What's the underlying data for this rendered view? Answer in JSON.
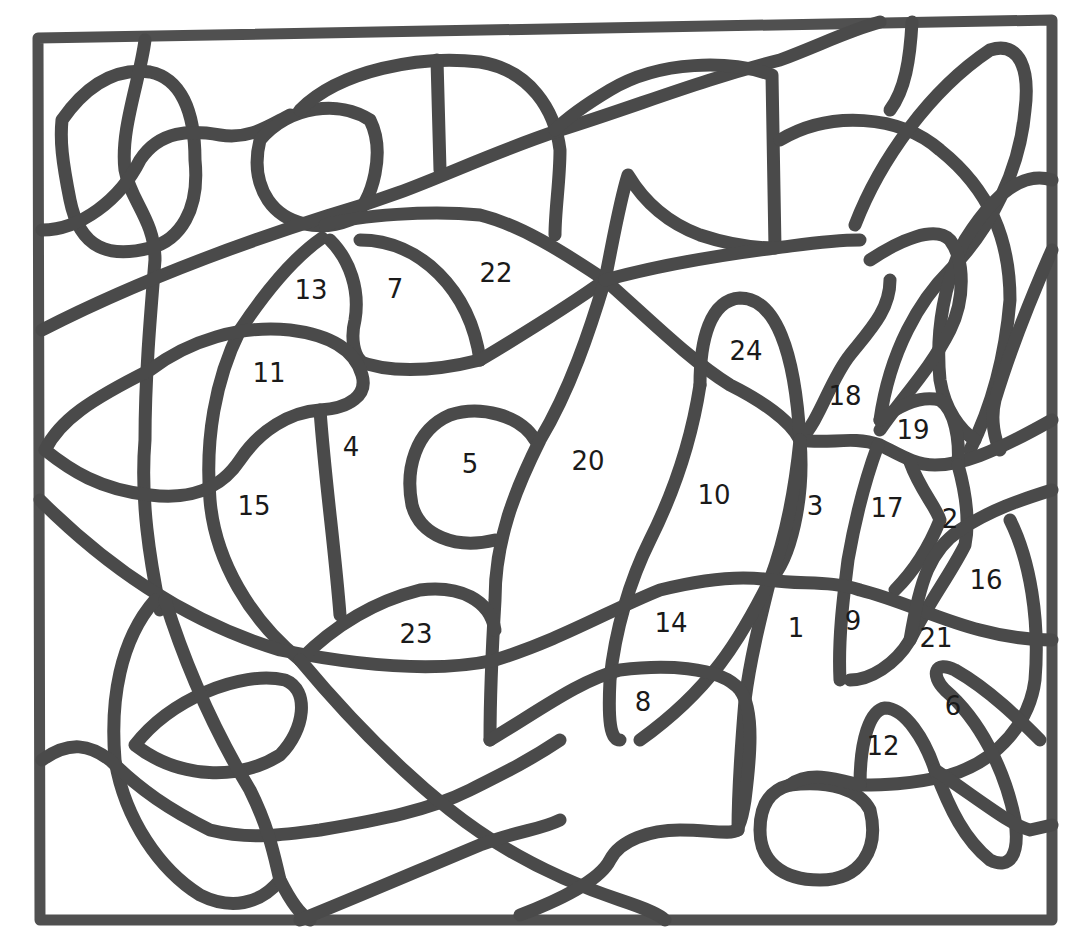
{
  "worksheet": {
    "type": "color-by-number",
    "line_color": "#4a4a4a",
    "background": "#ffffff",
    "regions": [
      {
        "label": "1",
        "x": 796,
        "y": 628
      },
      {
        "label": "2",
        "x": 950,
        "y": 519
      },
      {
        "label": "3",
        "x": 815,
        "y": 506
      },
      {
        "label": "4",
        "x": 351,
        "y": 447
      },
      {
        "label": "5",
        "x": 470,
        "y": 464
      },
      {
        "label": "6",
        "x": 953,
        "y": 706
      },
      {
        "label": "7",
        "x": 395,
        "y": 289
      },
      {
        "label": "8",
        "x": 643,
        "y": 702
      },
      {
        "label": "9",
        "x": 853,
        "y": 621
      },
      {
        "label": "10",
        "x": 714,
        "y": 495
      },
      {
        "label": "11",
        "x": 269,
        "y": 373
      },
      {
        "label": "12",
        "x": 883,
        "y": 746
      },
      {
        "label": "13",
        "x": 311,
        "y": 290
      },
      {
        "label": "14",
        "x": 671,
        "y": 623
      },
      {
        "label": "15",
        "x": 254,
        "y": 506
      },
      {
        "label": "16",
        "x": 986,
        "y": 580
      },
      {
        "label": "17",
        "x": 887,
        "y": 508
      },
      {
        "label": "18",
        "x": 845,
        "y": 396
      },
      {
        "label": "19",
        "x": 913,
        "y": 430
      },
      {
        "label": "20",
        "x": 588,
        "y": 461
      },
      {
        "label": "21",
        "x": 936,
        "y": 638
      },
      {
        "label": "22",
        "x": 496,
        "y": 273
      },
      {
        "label": "23",
        "x": 416,
        "y": 634
      },
      {
        "label": "24",
        "x": 746,
        "y": 351
      }
    ]
  }
}
